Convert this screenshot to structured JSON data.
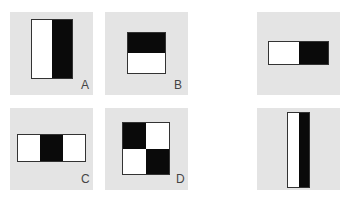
{
  "panels": [
    {
      "id": "A",
      "label": "A",
      "type": "two-rect-horizontal",
      "cells": [
        "white",
        "black"
      ]
    },
    {
      "id": "B",
      "label": "B",
      "type": "two-rect-vertical",
      "cells": [
        "black",
        "white"
      ]
    },
    {
      "id": "C",
      "label": "C",
      "type": "three-rect-horizontal",
      "cells": [
        "white",
        "black",
        "white"
      ]
    },
    {
      "id": "D",
      "label": "D",
      "type": "four-rect-checker",
      "cells": [
        "black",
        "white",
        "white",
        "black"
      ]
    },
    {
      "id": "E",
      "label": "",
      "type": "two-rect-horizontal-wide",
      "cells": [
        "white",
        "black"
      ]
    },
    {
      "id": "F",
      "label": "",
      "type": "two-rect-horizontal-tall",
      "cells": [
        "white",
        "black"
      ]
    }
  ],
  "colors": {
    "panel_bg": "#e4e4e4",
    "black": "#0a0a0a",
    "white": "#ffffff",
    "border": "#333333"
  }
}
